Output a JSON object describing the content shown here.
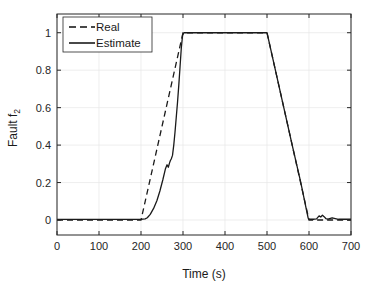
{
  "figure": {
    "background_color": "#ffffff",
    "axes_color": "#262626",
    "grid_color": "#e6e6e6",
    "line_color": "#1a1a1a"
  },
  "chart_data": {
    "type": "line",
    "title": "",
    "xlabel": "Time (s)",
    "ylabel": "Fault f₂",
    "ylabel_base": "Fault f",
    "ylabel_subscript": "2",
    "xlim": [
      0,
      700
    ],
    "ylim": [
      -0.08,
      1.1
    ],
    "xticks": [
      0,
      100,
      200,
      300,
      400,
      500,
      600,
      700
    ],
    "xticklabels": [
      "0",
      "100",
      "200",
      "300",
      "400",
      "500",
      "600",
      "700"
    ],
    "yticks": [
      0,
      0.2,
      0.4,
      0.6,
      0.8,
      1
    ],
    "yticklabels": [
      "0",
      "0.2",
      "0.4",
      "0.6",
      "0.8",
      "1"
    ],
    "grid": true,
    "legend_position": "upper left",
    "series": [
      {
        "name": "Real",
        "style": "dashed",
        "color": "#1a1a1a",
        "x": [
          0,
          50,
          100,
          150,
          200,
          210,
          220,
          230,
          240,
          250,
          260,
          270,
          280,
          290,
          300,
          350,
          400,
          450,
          500,
          520,
          540,
          560,
          580,
          600,
          620,
          650,
          700
        ],
        "y": [
          0,
          0,
          0,
          0,
          0,
          0.1,
          0.2,
          0.3,
          0.4,
          0.5,
          0.6,
          0.7,
          0.8,
          0.9,
          1,
          1,
          1,
          1,
          1,
          0.8,
          0.6,
          0.4,
          0.2,
          0,
          0,
          0,
          0
        ]
      },
      {
        "name": "Estimate",
        "style": "solid",
        "color": "#1a1a1a",
        "x": [
          0,
          50,
          100,
          150,
          200,
          210,
          215,
          222,
          230,
          238,
          245,
          252,
          258,
          262,
          265,
          268,
          270,
          272,
          275,
          278,
          281,
          284,
          287,
          290,
          293,
          296,
          299,
          302,
          310,
          350,
          400,
          450,
          500,
          520,
          540,
          560,
          580,
          598,
          600,
          610,
          618,
          624,
          628,
          632,
          636,
          640,
          645,
          655,
          670,
          700
        ],
        "y": [
          0.003,
          0.003,
          0.003,
          0.003,
          0.004,
          0.006,
          0.012,
          0.03,
          0.062,
          0.104,
          0.155,
          0.215,
          0.272,
          0.295,
          0.282,
          0.305,
          0.318,
          0.326,
          0.345,
          0.4,
          0.47,
          0.55,
          0.63,
          0.72,
          0.82,
          0.92,
          0.985,
          1.0,
          1.0,
          1.0,
          1.0,
          1.0,
          1.0,
          0.8,
          0.6,
          0.4,
          0.205,
          0.01,
          0.004,
          0.004,
          0.006,
          0.022,
          0.016,
          0.026,
          0.018,
          0.008,
          0.005,
          0.012,
          0.004,
          0.004
        ]
      }
    ]
  },
  "legend": {
    "items": [
      {
        "label": "Real",
        "style": "dashed"
      },
      {
        "label": "Estimate",
        "style": "solid"
      }
    ]
  }
}
